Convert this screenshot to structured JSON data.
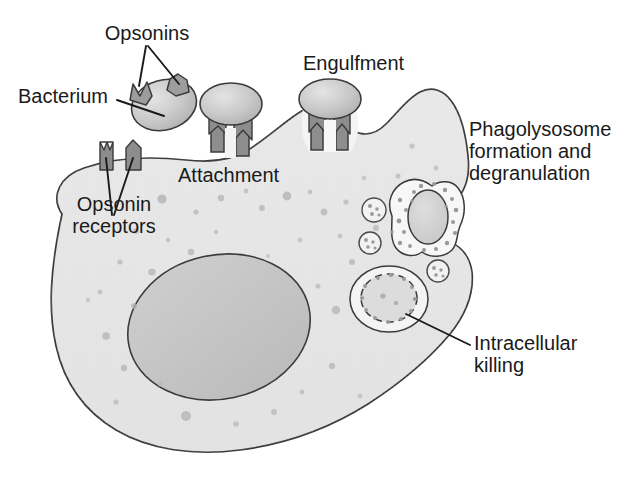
{
  "figure": {
    "type": "biological-process-diagram"
  },
  "labels": {
    "opsonins": "Opsonins",
    "bacterium": "Bacterium",
    "opsonin_receptors_line1": "Opsonin",
    "opsonin_receptors_line2": "receptors",
    "attachment": "Attachment",
    "engulfment": "Engulfment",
    "phagolysosome_line1": "Phagolysosome",
    "phagolysosome_line2": "formation and",
    "phagolysosome_line3": "degranulation",
    "intracellular_killing_line1": "Intracellular",
    "intracellular_killing_line2": "killing"
  },
  "colors": {
    "background": "#ffffff",
    "outline": "#3b3b3b",
    "cytoplasm": "#e6e6e6",
    "nucleus": "#c2c2c2",
    "bacterium_fill": "#c6c6c6",
    "opsonin_fill": "#9a9a9a",
    "receptor_fill": "#8f8f8f",
    "granule": "#b5b5b5",
    "vacuole_fill": "#f4f4f4",
    "text": "#1a1a1a"
  },
  "stages": [
    {
      "name": "opsonization",
      "label": "Opsonins"
    },
    {
      "name": "attachment",
      "label": "Attachment"
    },
    {
      "name": "engulfment",
      "label": "Engulfment"
    },
    {
      "name": "phagolysosome-formation",
      "label": "Phagolysosome formation and degranulation"
    },
    {
      "name": "intracellular-killing",
      "label": "Intracellular killing"
    }
  ]
}
